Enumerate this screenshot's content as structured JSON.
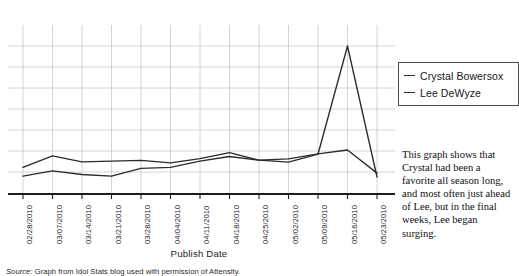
{
  "top_artifact_text": " ",
  "legend": {
    "entries": [
      {
        "label": "Crystal Bowersox",
        "marker": "line-dash-marker"
      },
      {
        "label": "Lee DeWyze",
        "marker": "line-dash-marker"
      }
    ]
  },
  "axis": {
    "x_title": "Publish Date"
  },
  "source": {
    "label": "Source:",
    "text": "Graph from Idol Stats blog used with permission of Attensity."
  },
  "caption": {
    "text": "This graph shows that Crystal had been a favorite all season long, and most often just ahead of Lee, but in the final weeks, Lee began surging."
  },
  "chart_data": {
    "type": "line",
    "title": "",
    "xlabel": "Publish Date",
    "ylabel": "",
    "grid": true,
    "legend_position": "right",
    "x": [
      "02/28/2010",
      "03/07/2010",
      "03/14/2010",
      "03/21/2010",
      "03/28/2010",
      "04/04/2010",
      "04/11/2010",
      "04/18/2010",
      "04/25/2010",
      "05/02/2010",
      "05/09/2010",
      "05/16/2010",
      "05/23/2010"
    ],
    "categories": [
      "02/28/2010",
      "03/07/2010",
      "03/14/2010",
      "03/21/2010",
      "03/28/2010",
      "04/04/2010",
      "04/11/2010",
      "04/18/2010",
      "04/25/2010",
      "05/02/2010",
      "05/09/2010",
      "05/16/2010",
      "05/23/2010"
    ],
    "ylim": [
      0,
      8
    ],
    "yticks": [
      1,
      2,
      3,
      4,
      5,
      6,
      7
    ],
    "ytick_labels_shown": false,
    "series": [
      {
        "name": "Crystal Bowersox",
        "color": "#2b2b2b",
        "values": [
          1.22,
          1.77,
          1.48,
          1.52,
          1.55,
          1.44,
          1.64,
          1.92,
          1.56,
          1.47,
          1.85,
          7.0,
          0.76
        ]
      },
      {
        "name": "Lee DeWyze",
        "color": "#2b2b2b",
        "values": [
          0.8,
          1.05,
          0.88,
          0.8,
          1.17,
          1.22,
          1.52,
          1.74,
          1.56,
          1.63,
          1.86,
          2.05,
          0.95
        ]
      }
    ],
    "annotations": []
  }
}
